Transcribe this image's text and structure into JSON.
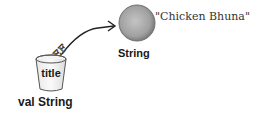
{
  "diagram": {
    "variable": {
      "name": "title",
      "declaration": "val String",
      "reference_label": "REF"
    },
    "object": {
      "type": "String",
      "value": "\"Chicken Bhuna\""
    },
    "colors": {
      "object_fill": "#a0a0a0",
      "object_edge": "#6a6a6a",
      "cup_stroke": "#555555",
      "arrow": "#222222"
    }
  }
}
